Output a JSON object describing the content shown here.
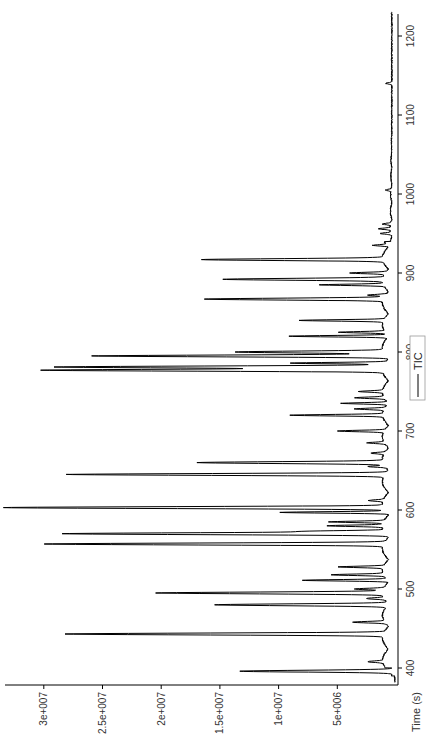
{
  "chart_data": {
    "type": "line",
    "orientation": "rotated-90-ccw",
    "title": "",
    "xlabel": "Time (s)",
    "ylabel": "",
    "xlim": [
      380,
      1230
    ],
    "ylim": [
      0,
      33000000
    ],
    "x_ticks": [
      400,
      500,
      600,
      700,
      800,
      900,
      1000,
      1100,
      1200
    ],
    "x_tick_labels": [
      "400",
      "500",
      "600",
      "700",
      "800",
      "900",
      "1000",
      "1100",
      "1200"
    ],
    "y_ticks": [
      5000000,
      10000000,
      15000000,
      20000000,
      25000000,
      30000000
    ],
    "y_tick_labels": [
      "5e+006",
      "1e+007",
      "1.5e+007",
      "2e+007",
      "2.5e+007",
      "3e+007"
    ],
    "grid": false,
    "legend": {
      "entries": [
        "TIC"
      ],
      "position": "bottom-center"
    },
    "series": [
      {
        "name": "TIC",
        "color": "#000000",
        "baseline": 300000,
        "peaks": [
          {
            "t": 396,
            "v": 13000000
          },
          {
            "t": 408,
            "v": 1300000
          },
          {
            "t": 443,
            "v": 27100000
          },
          {
            "t": 458,
            "v": 2800000
          },
          {
            "t": 480,
            "v": 14800000
          },
          {
            "t": 488,
            "v": 1500000
          },
          {
            "t": 495,
            "v": 19300000
          },
          {
            "t": 500,
            "v": 2500000
          },
          {
            "t": 511,
            "v": 7200000
          },
          {
            "t": 518,
            "v": 4500000
          },
          {
            "t": 528,
            "v": 3800000
          },
          {
            "t": 557,
            "v": 28900000
          },
          {
            "t": 570,
            "v": 27500000
          },
          {
            "t": 573,
            "v": 6200000
          },
          {
            "t": 580,
            "v": 4700000
          },
          {
            "t": 585,
            "v": 4700000
          },
          {
            "t": 597,
            "v": 9000000
          },
          {
            "t": 603,
            "v": 32400000
          },
          {
            "t": 612,
            "v": 1200000
          },
          {
            "t": 645,
            "v": 27200000
          },
          {
            "t": 655,
            "v": 1500000
          },
          {
            "t": 660,
            "v": 15800000
          },
          {
            "t": 672,
            "v": 1200000
          },
          {
            "t": 685,
            "v": 1500000
          },
          {
            "t": 700,
            "v": 4000000
          },
          {
            "t": 720,
            "v": 7900000
          },
          {
            "t": 728,
            "v": 2500000
          },
          {
            "t": 735,
            "v": 4000000
          },
          {
            "t": 742,
            "v": 2500000
          },
          {
            "t": 750,
            "v": 2000000
          },
          {
            "t": 777,
            "v": 29100000
          },
          {
            "t": 781,
            "v": 27900000
          },
          {
            "t": 786,
            "v": 8000000
          },
          {
            "t": 795,
            "v": 25100000
          },
          {
            "t": 800,
            "v": 12700000
          },
          {
            "t": 820,
            "v": 8500000
          },
          {
            "t": 825,
            "v": 4000000
          },
          {
            "t": 840,
            "v": 7200000
          },
          {
            "t": 867,
            "v": 15200000
          },
          {
            "t": 872,
            "v": 1500000
          },
          {
            "t": 885,
            "v": 5500000
          },
          {
            "t": 892,
            "v": 13600000
          },
          {
            "t": 900,
            "v": 3000000
          },
          {
            "t": 917,
            "v": 15400000
          },
          {
            "t": 935,
            "v": 1200000
          },
          {
            "t": 950,
            "v": 900000
          },
          {
            "t": 956,
            "v": 1000000
          },
          {
            "t": 962,
            "v": 700000
          },
          {
            "t": 1005,
            "v": 500000
          },
          {
            "t": 1140,
            "v": 500000
          }
        ]
      }
    ]
  }
}
